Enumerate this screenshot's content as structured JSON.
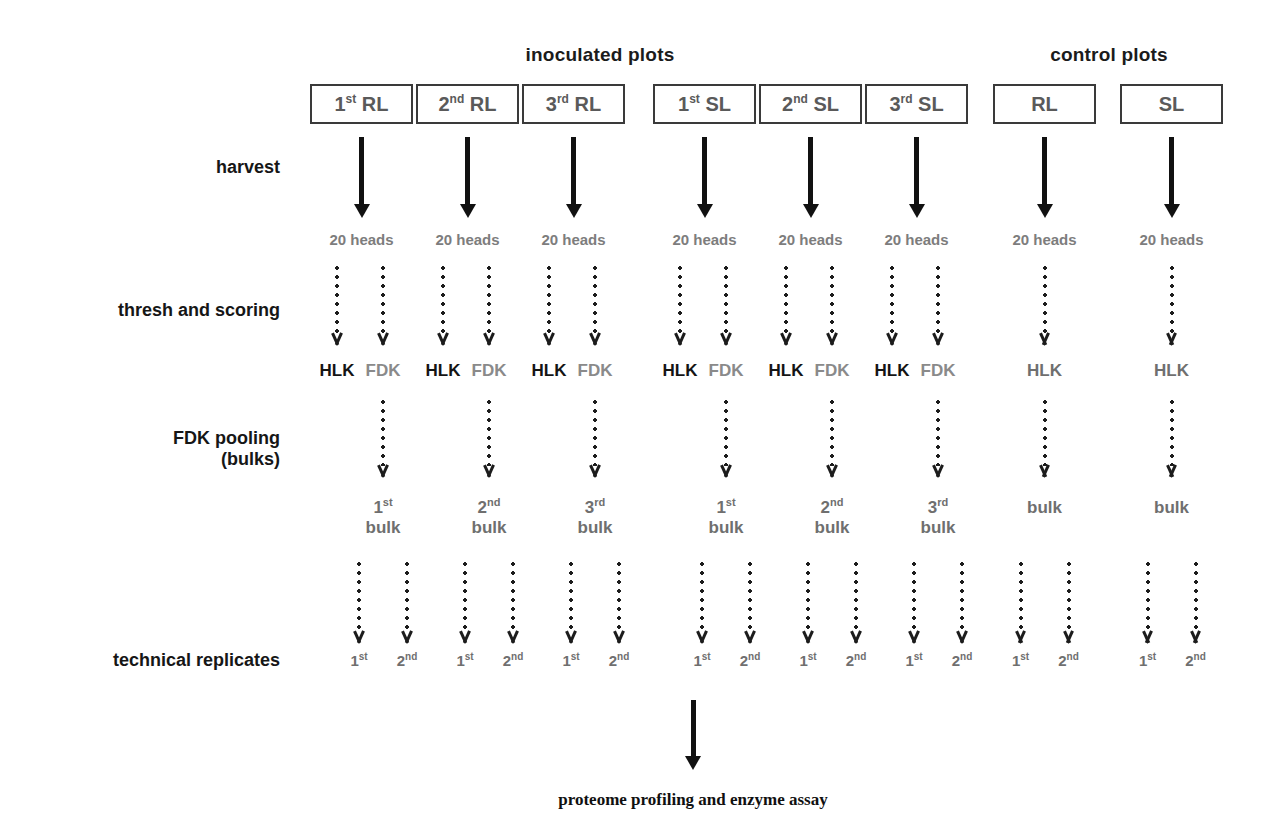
{
  "figure": {
    "type": "experimental-workflow-flowchart",
    "background_color": "#ffffff",
    "dark_text_color": "#141414",
    "gray_text_color": "#6f6f6f"
  },
  "group_headers": [
    {
      "id": "inoculated",
      "label": "inoculated plots"
    },
    {
      "id": "control",
      "label": "control plots"
    }
  ],
  "row_labels": [
    {
      "id": "harvest",
      "label": "harvest"
    },
    {
      "id": "thresh",
      "label": "thresh and scoring"
    },
    {
      "id": "pooling",
      "label": "FDK pooling\n(bulks)"
    },
    {
      "id": "replicates",
      "label": "technical replicates"
    }
  ],
  "columns": [
    {
      "id": "rl1",
      "group": "inoculated",
      "box_ordinal": "1",
      "box_suffix": "st",
      "box_name": "RL",
      "heads": "20 heads",
      "fractions": [
        {
          "id": "hlk",
          "label": "HLK",
          "style": "dark"
        },
        {
          "id": "fdk",
          "label": "FDK",
          "style": "light"
        }
      ],
      "bulk_ordinal": "1",
      "bulk_suffix": "st",
      "bulk_label": "bulk",
      "replicates": [
        {
          "ordinal": "1",
          "suffix": "st"
        },
        {
          "ordinal": "2",
          "suffix": "nd"
        }
      ]
    },
    {
      "id": "rl2",
      "group": "inoculated",
      "box_ordinal": "2",
      "box_suffix": "nd",
      "box_name": "RL",
      "heads": "20 heads",
      "fractions": [
        {
          "id": "hlk",
          "label": "HLK",
          "style": "dark"
        },
        {
          "id": "fdk",
          "label": "FDK",
          "style": "light"
        }
      ],
      "bulk_ordinal": "2",
      "bulk_suffix": "nd",
      "bulk_label": "bulk",
      "replicates": [
        {
          "ordinal": "1",
          "suffix": "st"
        },
        {
          "ordinal": "2",
          "suffix": "nd"
        }
      ]
    },
    {
      "id": "rl3",
      "group": "inoculated",
      "box_ordinal": "3",
      "box_suffix": "rd",
      "box_name": "RL",
      "heads": "20 heads",
      "fractions": [
        {
          "id": "hlk",
          "label": "HLK",
          "style": "dark"
        },
        {
          "id": "fdk",
          "label": "FDK",
          "style": "light"
        }
      ],
      "bulk_ordinal": "3",
      "bulk_suffix": "rd",
      "bulk_label": "bulk",
      "replicates": [
        {
          "ordinal": "1",
          "suffix": "st"
        },
        {
          "ordinal": "2",
          "suffix": "nd"
        }
      ]
    },
    {
      "id": "sl1",
      "group": "inoculated",
      "box_ordinal": "1",
      "box_suffix": "st",
      "box_name": "SL",
      "heads": "20 heads",
      "fractions": [
        {
          "id": "hlk",
          "label": "HLK",
          "style": "dark"
        },
        {
          "id": "fdk",
          "label": "FDK",
          "style": "light"
        }
      ],
      "bulk_ordinal": "1",
      "bulk_suffix": "st",
      "bulk_label": "bulk",
      "replicates": [
        {
          "ordinal": "1",
          "suffix": "st"
        },
        {
          "ordinal": "2",
          "suffix": "nd"
        }
      ]
    },
    {
      "id": "sl2",
      "group": "inoculated",
      "box_ordinal": "2",
      "box_suffix": "nd",
      "box_name": "SL",
      "heads": "20 heads",
      "fractions": [
        {
          "id": "hlk",
          "label": "HLK",
          "style": "dark"
        },
        {
          "id": "fdk",
          "label": "FDK",
          "style": "light"
        }
      ],
      "bulk_ordinal": "2",
      "bulk_suffix": "nd",
      "bulk_label": "bulk",
      "replicates": [
        {
          "ordinal": "1",
          "suffix": "st"
        },
        {
          "ordinal": "2",
          "suffix": "nd"
        }
      ]
    },
    {
      "id": "sl3",
      "group": "inoculated",
      "box_ordinal": "3",
      "box_suffix": "rd",
      "box_name": "SL",
      "heads": "20 heads",
      "fractions": [
        {
          "id": "hlk",
          "label": "HLK",
          "style": "dark"
        },
        {
          "id": "fdk",
          "label": "FDK",
          "style": "light"
        }
      ],
      "bulk_ordinal": "3",
      "bulk_suffix": "rd",
      "bulk_label": "bulk",
      "replicates": [
        {
          "ordinal": "1",
          "suffix": "st"
        },
        {
          "ordinal": "2",
          "suffix": "nd"
        }
      ]
    },
    {
      "id": "ctrl_rl",
      "group": "control",
      "box_ordinal": "",
      "box_suffix": "",
      "box_name": "RL",
      "heads": "20 heads",
      "fractions": [
        {
          "id": "hlk",
          "label": "HLK",
          "style": "control"
        }
      ],
      "bulk_ordinal": "",
      "bulk_suffix": "",
      "bulk_label": "bulk",
      "replicates": [
        {
          "ordinal": "1",
          "suffix": "st"
        },
        {
          "ordinal": "2",
          "suffix": "nd"
        }
      ]
    },
    {
      "id": "ctrl_sl",
      "group": "control",
      "box_ordinal": "",
      "box_suffix": "",
      "box_name": "SL",
      "heads": "20 heads",
      "fractions": [
        {
          "id": "hlk",
          "label": "HLK",
          "style": "control"
        }
      ],
      "bulk_ordinal": "",
      "bulk_suffix": "",
      "bulk_label": "bulk",
      "replicates": [
        {
          "ordinal": "1",
          "suffix": "st"
        },
        {
          "ordinal": "2",
          "suffix": "nd"
        }
      ]
    }
  ],
  "footer": {
    "label": "proteome profiling and enzyme assay"
  }
}
